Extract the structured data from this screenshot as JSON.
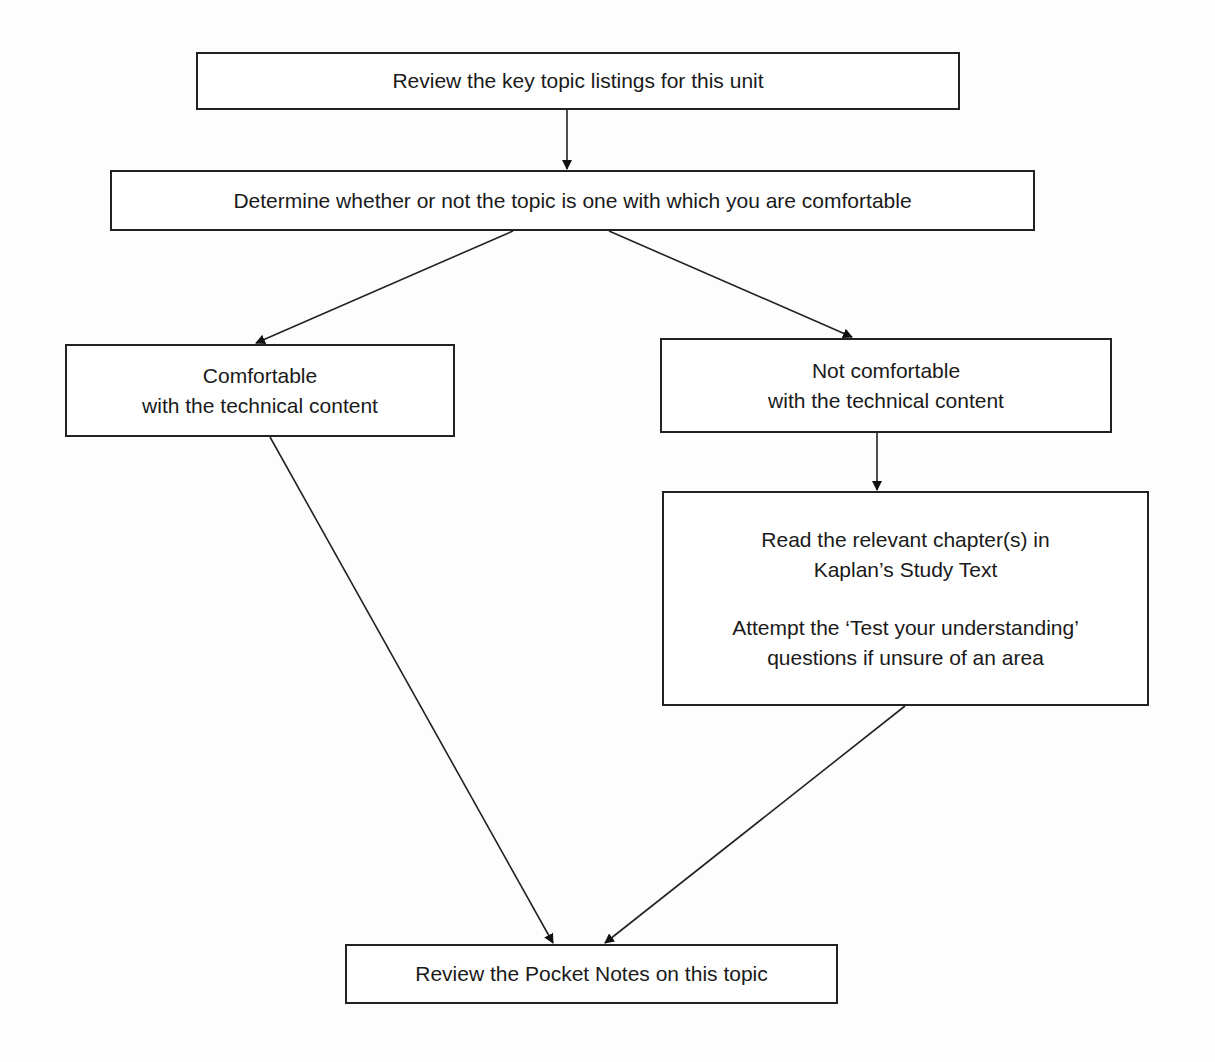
{
  "flowchart": {
    "nodes": {
      "review_key_topics": {
        "lines": [
          "Review the key topic listings for this unit"
        ]
      },
      "determine_comfort": {
        "lines": [
          "Determine whether or not the topic is one with which you are comfortable"
        ]
      },
      "comfortable": {
        "lines": [
          "Comfortable",
          "with the technical content"
        ]
      },
      "not_comfortable": {
        "lines": [
          "Not comfortable",
          "with the technical content"
        ]
      },
      "read_and_attempt": {
        "para1": [
          "Read the relevant chapter(s) in",
          "Kaplan’s Study Text"
        ],
        "para2": [
          "Attempt the ‘Test your understanding’",
          "questions if unsure of an area"
        ]
      },
      "review_pocket_notes": {
        "lines": [
          "Review the Pocket Notes on this topic"
        ]
      }
    },
    "edges": [
      {
        "from": "review_key_topics",
        "to": "determine_comfort"
      },
      {
        "from": "determine_comfort",
        "to": "comfortable"
      },
      {
        "from": "determine_comfort",
        "to": "not_comfortable"
      },
      {
        "from": "not_comfortable",
        "to": "read_and_attempt"
      },
      {
        "from": "comfortable",
        "to": "review_pocket_notes"
      },
      {
        "from": "read_and_attempt",
        "to": "review_pocket_notes"
      }
    ],
    "colors": {
      "stroke": "#222222",
      "background": "#ffffff",
      "text": "#1a1a1a"
    }
  }
}
